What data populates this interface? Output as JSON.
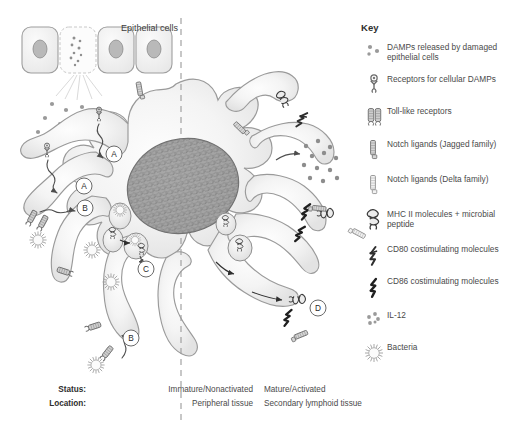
{
  "figure": {
    "title_text": "Epithelial cells",
    "divider": "dashed-vertical-midline"
  },
  "key": {
    "heading": "Key",
    "items": [
      {
        "icon": "damps-dots-icon",
        "label": "DAMPs released by damaged epithelial cells"
      },
      {
        "icon": "damp-receptor-icon",
        "label": "Receptors for cellular DAMPs"
      },
      {
        "icon": "toll-like-receptor-icon",
        "label": "Toll-like receptors"
      },
      {
        "icon": "notch-ligand-jagged-icon",
        "label": "Notch ligands (Jagged family)"
      },
      {
        "icon": "notch-ligand-delta-icon",
        "label": "Notch ligands (Delta family)"
      },
      {
        "icon": "mhc-ii-peptide-icon",
        "label": "MHC II molecules + microbial peptide"
      },
      {
        "icon": "cd80-icon",
        "label": "CD80 costimulating molecules"
      },
      {
        "icon": "cd86-icon",
        "label": "CD86 costimulating molecules"
      },
      {
        "icon": "il12-dots-icon",
        "label": "IL-12"
      },
      {
        "icon": "bacteria-icon",
        "label": "Bacteria"
      }
    ]
  },
  "status_table": {
    "rows": [
      {
        "key": "Status:",
        "left": "Immature/Nonactivated",
        "right": "Mature/Activated"
      },
      {
        "key": "Location:",
        "left": "Peripheral tissue",
        "right": "Secondary lymphoid tissue"
      }
    ]
  },
  "callouts": [
    {
      "id": "A",
      "x": 84,
      "y": 186
    },
    {
      "id": "A",
      "x": 114,
      "y": 154
    },
    {
      "id": "B",
      "x": 85,
      "y": 208
    },
    {
      "id": "B",
      "x": 131,
      "y": 338
    },
    {
      "id": "C",
      "x": 146,
      "y": 269
    },
    {
      "id": "D",
      "x": 318,
      "y": 308
    }
  ],
  "colors": {
    "background": "#ffffff",
    "text": "#4a4a4a",
    "heading": "#2e2e2e",
    "cell_fill": "#f2f2f2",
    "cell_stroke": "#9a9a9a",
    "nucleus_fill": "#a8a8a8",
    "nucleus_stroke": "#6f6f6f",
    "molecule_gray": "#8d8d8d",
    "dark_molecule": "#2f2f2f",
    "divider": "#9a9a9a"
  }
}
